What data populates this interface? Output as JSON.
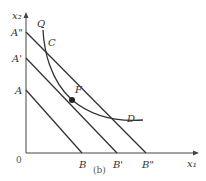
{
  "diagram": {
    "caption": "(b)",
    "axes": {
      "x_label": "x₁",
      "y_label": "x₂",
      "origin_label": "0"
    },
    "y_intercepts": [
      "A\"",
      "A'",
      "A"
    ],
    "x_intercepts": [
      "B",
      "B'",
      "B\""
    ],
    "curve_label": "Q",
    "points": {
      "C": "C",
      "F": "F",
      "D": "D"
    },
    "lines": [
      {
        "name": "AB",
        "from": "A",
        "to": "B"
      },
      {
        "name": "A'B'",
        "from": "A'",
        "to": "B'"
      },
      {
        "name": "A\"B\"",
        "from": "A\"",
        "to": "B\""
      }
    ],
    "colors": {
      "line": "#333333",
      "background": "#ffffff"
    }
  }
}
